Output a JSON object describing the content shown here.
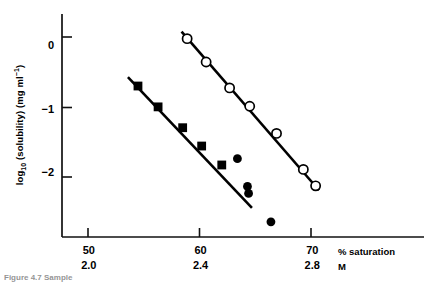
{
  "figure": {
    "caption": "Figure 4.7  Sample",
    "background_color": "#ffffff",
    "ink_color": "#000000"
  },
  "chart_data": {
    "type": "scatter",
    "title": "",
    "xlabel": "% saturation",
    "xlabel_secondary": "M",
    "ylabel": "log10 (solubility) (mg ml-1)",
    "ylabel_parts": {
      "prefix": "log",
      "subscript": "10",
      "middle": " (solubility) (mg ml",
      "superscript": "−1",
      "suffix": ")"
    },
    "xlim": [
      47.6,
      80.0
    ],
    "ylim": [
      -3.0,
      0.53
    ],
    "grid": false,
    "legend": "none",
    "xticks": [
      50,
      60,
      70
    ],
    "xticklabels": [
      "50",
      "60",
      "70"
    ],
    "xticks_secondary": [
      50,
      60,
      70
    ],
    "xticklabels_secondary": [
      "2.0",
      "2.4",
      "2.8"
    ],
    "yticks": [
      0,
      -1,
      -2
    ],
    "yticklabels": [
      "0",
      "−1",
      "−2"
    ],
    "series": [
      {
        "name": "open-circle-series",
        "marker": "open-circle",
        "marker_size": 4.6,
        "fit_line": {
          "x0": 58.3,
          "y0": 0.25,
          "x1": 70.6,
          "y1": -2.26
        },
        "points": [
          {
            "x": 58.8,
            "y": 0.14
          },
          {
            "x": 60.5,
            "y": -0.23
          },
          {
            "x": 62.6,
            "y": -0.64
          },
          {
            "x": 64.4,
            "y": -0.93
          },
          {
            "x": 66.8,
            "y": -1.36
          },
          {
            "x": 69.2,
            "y": -1.93
          },
          {
            "x": 70.3,
            "y": -2.19
          }
        ]
      },
      {
        "name": "filled-square-series",
        "marker": "filled-square",
        "marker_size": 4.4,
        "fit_line": {
          "x0": 53.5,
          "y0": -0.47,
          "x1": 64.6,
          "y1": -2.54
        },
        "points": [
          {
            "x": 54.4,
            "y": -0.61
          },
          {
            "x": 56.2,
            "y": -0.94
          },
          {
            "x": 58.4,
            "y": -1.27
          },
          {
            "x": 60.1,
            "y": -1.56
          },
          {
            "x": 61.9,
            "y": -1.86
          }
        ]
      },
      {
        "name": "filled-circle-series",
        "marker": "filled-circle",
        "marker_size": 4.4,
        "fit_line": null,
        "points": [
          {
            "x": 63.3,
            "y": -1.76
          },
          {
            "x": 64.2,
            "y": -2.2
          },
          {
            "x": 64.3,
            "y": -2.31
          },
          {
            "x": 66.3,
            "y": -2.76
          }
        ]
      }
    ]
  }
}
